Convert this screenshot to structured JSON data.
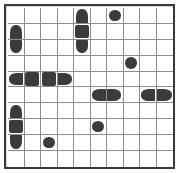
{
  "puzzle": {
    "kind": "battleship-grid",
    "rows": 10,
    "columns": 10,
    "colors": {
      "ship": "#3b3b3b",
      "grid_line": "#8d8d8d",
      "frame": "#3a3a3a",
      "background": "#ffffff"
    },
    "legend": {
      "single": "single-round-submarine",
      "middle": "square-middle-section",
      "cap-top": "rounded-top-end-cap",
      "cap-bottom": "rounded-bottom-end-cap",
      "cap-left": "rounded-left-end-cap",
      "cap-right": "rounded-right-end-cap",
      "empty": "empty-water-cell"
    },
    "cells": [
      [
        "empty",
        "empty",
        "empty",
        "empty",
        "cap-top",
        "empty",
        "single",
        "empty",
        "empty",
        "empty"
      ],
      [
        "cap-top",
        "empty",
        "empty",
        "empty",
        "middle",
        "empty",
        "empty",
        "empty",
        "empty",
        "empty"
      ],
      [
        "cap-bottom",
        "empty",
        "empty",
        "empty",
        "cap-bottom",
        "empty",
        "empty",
        "empty",
        "empty",
        "empty"
      ],
      [
        "empty",
        "empty",
        "empty",
        "empty",
        "empty",
        "empty",
        "empty",
        "single",
        "empty",
        "empty"
      ],
      [
        "cap-left",
        "middle",
        "middle",
        "cap-right",
        "empty",
        "empty",
        "empty",
        "empty",
        "empty",
        "empty"
      ],
      [
        "empty",
        "empty",
        "empty",
        "empty",
        "empty",
        "cap-left",
        "cap-right",
        "empty",
        "cap-left",
        "cap-right"
      ],
      [
        "cap-top",
        "empty",
        "empty",
        "empty",
        "empty",
        "empty",
        "empty",
        "empty",
        "empty",
        "empty"
      ],
      [
        "middle",
        "empty",
        "empty",
        "empty",
        "empty",
        "single",
        "empty",
        "empty",
        "empty",
        "empty"
      ],
      [
        "cap-bottom",
        "empty",
        "single",
        "empty",
        "empty",
        "empty",
        "empty",
        "empty",
        "empty",
        "empty"
      ],
      [
        "empty",
        "empty",
        "empty",
        "empty",
        "empty",
        "empty",
        "empty",
        "empty",
        "empty",
        "empty"
      ]
    ]
  }
}
